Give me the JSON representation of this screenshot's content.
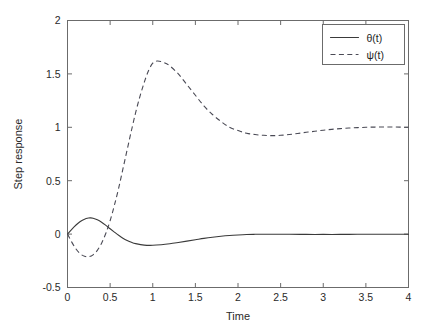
{
  "chart_data": {
    "type": "line",
    "title": "",
    "xlabel": "Time",
    "ylabel": "Step response",
    "xlim": [
      0,
      4
    ],
    "ylim": [
      -0.5,
      2
    ],
    "grid": false,
    "legend_position": "top-right",
    "xticks": [
      0,
      0.5,
      1,
      1.5,
      2,
      2.5,
      3,
      3.5,
      4
    ],
    "xtick_labels": [
      "0",
      "0.5",
      "1",
      "1.5",
      "2",
      "2.5",
      "3",
      "3.5",
      "4"
    ],
    "yticks": [
      -0.5,
      0,
      0.5,
      1,
      1.5,
      2
    ],
    "ytick_labels": [
      "-0.5",
      "0",
      "0.5",
      "1",
      "1.5",
      "2"
    ],
    "series": [
      {
        "name": "θ(t)",
        "style": "solid",
        "color": "#3a3a3a",
        "x": [
          0,
          0.05,
          0.1,
          0.15,
          0.2,
          0.25,
          0.27,
          0.3,
          0.35,
          0.4,
          0.45,
          0.5,
          0.55,
          0.6,
          0.65,
          0.7,
          0.75,
          0.8,
          0.9,
          1.0,
          1.1,
          1.2,
          1.3,
          1.4,
          1.5,
          1.6,
          1.7,
          1.8,
          1.9,
          2.0,
          2.1,
          2.2,
          2.3,
          2.4,
          2.5,
          2.6,
          2.8,
          3.0,
          3.2,
          3.4,
          3.6,
          3.8,
          4.0
        ],
        "y": [
          0,
          0.045,
          0.085,
          0.118,
          0.14,
          0.151,
          0.152,
          0.149,
          0.134,
          0.111,
          0.082,
          0.05,
          0.019,
          -0.011,
          -0.038,
          -0.06,
          -0.077,
          -0.089,
          -0.103,
          -0.105,
          -0.1,
          -0.091,
          -0.079,
          -0.066,
          -0.053,
          -0.04,
          -0.029,
          -0.02,
          -0.013,
          -0.008,
          -0.004,
          -0.002,
          -0.001,
          -0.001,
          -0.001,
          -0.002,
          -0.003,
          -0.003,
          -0.003,
          -0.002,
          -0.002,
          -0.001,
          -0.001
        ]
      },
      {
        "name": "ψ(t)",
        "style": "dashed",
        "color": "#4a4a55",
        "x": [
          0,
          0.05,
          0.1,
          0.15,
          0.2,
          0.25,
          0.3,
          0.35,
          0.4,
          0.45,
          0.5,
          0.55,
          0.6,
          0.65,
          0.7,
          0.75,
          0.8,
          0.85,
          0.9,
          0.95,
          1.0,
          1.05,
          1.1,
          1.15,
          1.2,
          1.3,
          1.4,
          1.5,
          1.6,
          1.7,
          1.8,
          1.9,
          2.0,
          2.1,
          2.2,
          2.3,
          2.4,
          2.5,
          2.6,
          2.7,
          2.8,
          2.9,
          3.0,
          3.1,
          3.2,
          3.3,
          3.4,
          3.5,
          3.6,
          3.7,
          3.8,
          3.9,
          4.0
        ],
        "y": [
          0,
          -0.075,
          -0.14,
          -0.185,
          -0.207,
          -0.212,
          -0.194,
          -0.152,
          -0.085,
          0.008,
          0.125,
          0.27,
          0.43,
          0.61,
          0.79,
          0.97,
          1.14,
          1.29,
          1.42,
          1.53,
          1.6,
          1.62,
          1.615,
          1.6,
          1.575,
          1.5,
          1.4,
          1.3,
          1.2,
          1.12,
          1.055,
          1.0,
          0.97,
          0.945,
          0.932,
          0.925,
          0.922,
          0.925,
          0.932,
          0.942,
          0.953,
          0.963,
          0.973,
          0.981,
          0.988,
          0.993,
          0.997,
          1.0,
          1.002,
          1.003,
          1.003,
          1.002,
          1.0
        ]
      }
    ],
    "legend": [
      {
        "label": "θ(t)",
        "style": "solid"
      },
      {
        "label": "ψ(t)",
        "style": "dashed"
      }
    ]
  },
  "colors": {
    "axis": "#6b6b6b",
    "text": "#2a2a2a",
    "background": "#ffffff"
  }
}
